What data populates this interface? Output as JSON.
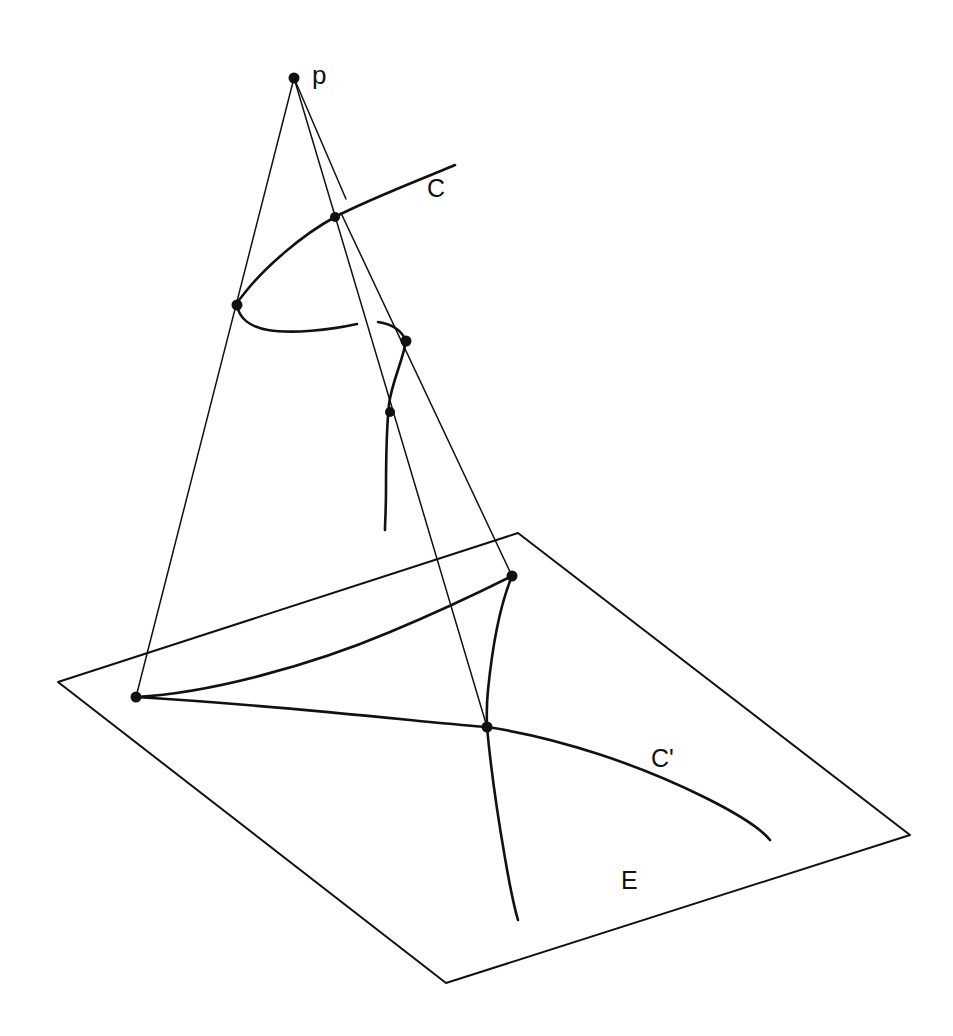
{
  "figure": {
    "background_color": "#ffffff",
    "ink_color": "#111111",
    "width": 953,
    "height": 1036,
    "labels": [
      {
        "id": "p",
        "text": "p",
        "x": 312,
        "y": 62,
        "description": "center of projection (apex point)"
      },
      {
        "id": "C",
        "text": "C",
        "x": 427,
        "y": 176,
        "description": "space curve label"
      },
      {
        "id": "Cp",
        "text": "C'",
        "x": 651,
        "y": 746,
        "description": "projected image curve label"
      },
      {
        "id": "E",
        "text": "E",
        "x": 621,
        "y": 868,
        "description": "plane label"
      }
    ],
    "points": [
      {
        "id": "apex",
        "x": 294,
        "y": 78,
        "r": 5.5,
        "name": "projection-center-p"
      },
      {
        "id": "c-upper",
        "x": 335,
        "y": 217,
        "r": 5.0,
        "name": "curve-point-upper"
      },
      {
        "id": "c-cusp",
        "x": 237,
        "y": 305,
        "r": 5.5,
        "name": "curve-cusp-point"
      },
      {
        "id": "c-fold",
        "x": 406,
        "y": 341,
        "r": 5.5,
        "name": "curve-fold-point"
      },
      {
        "id": "c-lower",
        "x": 390,
        "y": 412,
        "r": 5.0,
        "name": "curve-point-lower"
      },
      {
        "id": "e-cusp-top",
        "x": 512,
        "y": 576,
        "r": 5.5,
        "name": "image-cusp-point"
      },
      {
        "id": "e-left",
        "x": 136,
        "y": 697,
        "r": 5.5,
        "name": "image-left-cusp-point"
      },
      {
        "id": "e-cross",
        "x": 487,
        "y": 727,
        "r": 5.5,
        "name": "image-crossing-point"
      }
    ],
    "plane": {
      "name": "plane-E",
      "corners": [
        {
          "x": 58,
          "y": 682
        },
        {
          "x": 518,
          "y": 533
        },
        {
          "x": 910,
          "y": 835
        },
        {
          "x": 446,
          "y": 983
        }
      ]
    },
    "projection_lines": [
      {
        "id": "ray-left",
        "from": {
          "x": 294,
          "y": 78
        },
        "to": {
          "x": 136,
          "y": 697
        },
        "name": "projection-ray-left"
      },
      {
        "id": "ray-middle",
        "from": {
          "x": 294,
          "y": 78
        },
        "to": {
          "x": 487,
          "y": 727
        },
        "name": "projection-ray-middle"
      },
      {
        "id": "ray-short",
        "from": {
          "x": 294,
          "y": 78
        },
        "to": {
          "x": 346,
          "y": 199
        },
        "name": "projection-ray-short"
      },
      {
        "id": "ray-right",
        "from": {
          "x": 341,
          "y": 213
        },
        "to": {
          "x": 512,
          "y": 576
        },
        "name": "projection-ray-right"
      }
    ],
    "curve_C": {
      "name": "space-curve-C",
      "segments": [
        {
          "id": "C-main",
          "d": "M 455 165 C 420 180 372 198 335 217 C 300 236 265 268 247 290 C 239 300 236 304 237 305"
        },
        {
          "id": "C-fold1",
          "d": "M 237 305 C 239 318 250 327 268 330 C 292 334 330 330 357 324"
        },
        {
          "id": "C-fold2",
          "d": "M 378 322 C 392 324 402 331 406 341"
        },
        {
          "id": "C-tail",
          "d": "M 406 341 C 403 360 392 382 389 404 C 387 424 386 460 386 490 C 386 510 385 522 385 530"
        }
      ]
    },
    "curve_Cprime": {
      "name": "image-curve-C-prime",
      "segments": [
        {
          "id": "Cp-upper",
          "d": "M 136 697 C 210 693 312 665 390 632 C 450 607 492 586 512 576"
        },
        {
          "id": "Cp-fold",
          "d": "M 512 576 C 500 605 492 650 488 690 C 486 710 487 720 487 727"
        },
        {
          "id": "Cp-tail",
          "d": "M 487 727 C 490 760 497 812 505 858 C 511 893 515 910 518 920"
        },
        {
          "id": "Cp-long",
          "d": "M 136 697 C 220 702 330 712 410 720 C 450 724 474 726 487 727 C 560 738 640 765 706 798 C 742 816 762 830 770 840"
        }
      ]
    }
  }
}
